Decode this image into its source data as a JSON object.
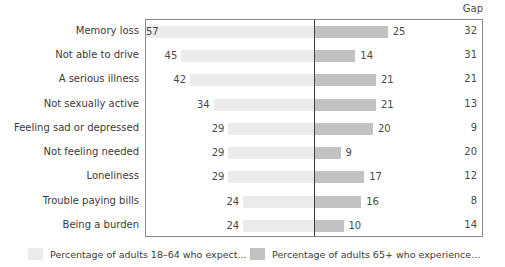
{
  "header": {
    "gap_label": "Gap"
  },
  "chart_data": {
    "type": "bar",
    "subtype": "diverging-butterfly",
    "title": "",
    "xlabel": "",
    "ylabel": "",
    "grid": false,
    "legend_position": "bottom",
    "center_divider": true,
    "axis_max": 60,
    "categories": [
      "Memory loss",
      "Not able to drive",
      "A serious illness",
      "Not sexually active",
      "Feeling sad or depressed",
      "Not feeling needed",
      "Loneliness",
      "Trouble paying bills",
      "Being a burden"
    ],
    "series": [
      {
        "name": "Percentage of adults 18–64 who expect...",
        "side": "left",
        "color": "#ebebeb",
        "values": [
          57,
          45,
          42,
          34,
          29,
          29,
          29,
          24,
          24
        ]
      },
      {
        "name": "Percentage of adults 65+ who experience...",
        "side": "right",
        "color": "#c2c2c2",
        "values": [
          25,
          14,
          21,
          21,
          20,
          9,
          17,
          16,
          10
        ]
      }
    ],
    "gap_column": {
      "label": "Gap",
      "values": [
        32,
        31,
        21,
        13,
        9,
        20,
        12,
        8,
        14
      ]
    }
  },
  "legend": [
    {
      "swatch": "light",
      "label": "Percentage of adults 18–64 who expect..."
    },
    {
      "swatch": "dark",
      "label": "Percentage of adults 65+ who experience..."
    }
  ],
  "colors": {
    "bar_left": "#ebebeb",
    "bar_right": "#c2c2c2",
    "frame": "#8a8a8a",
    "center_line": "#3d3d3d",
    "text": "#3a3a3a"
  }
}
